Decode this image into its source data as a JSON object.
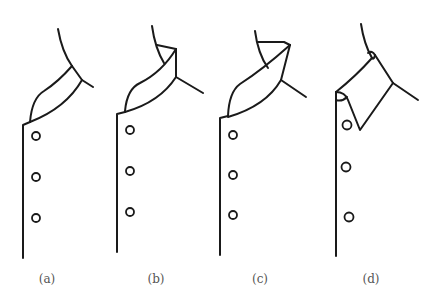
{
  "figure": {
    "panels": [
      {
        "id": "a",
        "label": "(a)",
        "style": "stand-up collar, rounded",
        "buttons": 3
      },
      {
        "id": "b",
        "label": "(b)",
        "style": "stand-up collar, folded flat top",
        "buttons": 3
      },
      {
        "id": "c",
        "label": "(c)",
        "style": "stand-up collar, pointed fold",
        "buttons": 3
      },
      {
        "id": "d",
        "label": "(d)",
        "style": "turn-down pointed collar",
        "buttons": 3
      }
    ],
    "colors": {
      "line": "#1a1a1a",
      "caption": "#555555",
      "background": "#ffffff"
    }
  }
}
